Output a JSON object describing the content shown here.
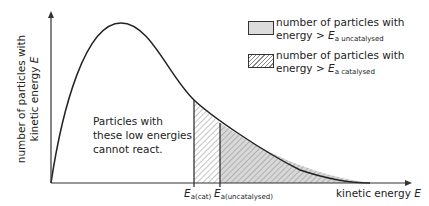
{
  "diagram": {
    "y_axis_label_line1": "number of particles with",
    "y_axis_label_line2": "kinetic energy",
    "y_axis_label_var": "E",
    "x_axis_label": "kinetic energy",
    "x_axis_var": "E",
    "annotation_line1": "Particles with",
    "annotation_line2": "these low energies",
    "annotation_line3": "cannot react.",
    "marker_cat_E": "E",
    "marker_cat_sub": "a(cat)",
    "marker_uncat_E": "E",
    "marker_uncat_sub": "a(uncatalysed)",
    "legend": [
      {
        "line1": "number of particles with",
        "line2_prefix": "energy > ",
        "var": "E",
        "sub": "a uncatalysed",
        "fill": "grey"
      },
      {
        "line1": "number of particles with",
        "line2_prefix": "energy > ",
        "var": "E",
        "sub": "a catalysed",
        "fill": "hatched"
      }
    ],
    "colors": {
      "line": "#222222",
      "grey_fill": "#dcdcdc",
      "hatch": "#888888"
    }
  }
}
